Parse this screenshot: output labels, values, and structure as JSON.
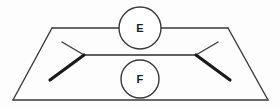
{
  "diagram": {
    "background_color": "#fdfdfd",
    "line_color": "#3a3a3a",
    "thick_line_color": "#1a1a1a",
    "label_color": "#1d1d1d",
    "nodes": [
      {
        "id": "node-e",
        "label": "E",
        "cx": 140,
        "cy": 28,
        "r": 21,
        "position": "top"
      },
      {
        "id": "node-f",
        "label": "F",
        "cx": 140,
        "cy": 79,
        "r": 19,
        "position": "bottom"
      }
    ],
    "outline": {
      "name": "trapezoid",
      "top_left": [
        52,
        28
      ],
      "top_right": [
        228,
        28
      ],
      "bottom_right": [
        268,
        100
      ],
      "bottom_left": [
        13,
        100
      ],
      "top_edge_left_segment": [
        [
          52,
          28
        ],
        [
          119,
          28
        ]
      ],
      "top_edge_right_segment": [
        [
          161,
          28
        ],
        [
          228,
          28
        ]
      ]
    },
    "connectors": {
      "center_line": [
        [
          84,
          55
        ],
        [
          196,
          55
        ]
      ],
      "left_chevron_thin_arm": [
        [
          84,
          55
        ],
        [
          62,
          42
        ]
      ],
      "left_chevron_thick_arm": [
        [
          84,
          55
        ],
        [
          50,
          80
        ]
      ],
      "right_chevron_thin_arm": [
        [
          196,
          55
        ],
        [
          218,
          42
        ]
      ],
      "right_chevron_thick_arm": [
        [
          196,
          55
        ],
        [
          230,
          80
        ]
      ]
    }
  }
}
